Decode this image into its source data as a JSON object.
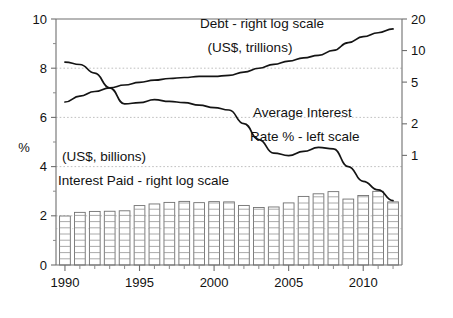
{
  "chart_data": {
    "type": "line",
    "title": "",
    "subtitle": "",
    "xlabel": "",
    "ylabel": "%",
    "y2label": "",
    "grid": true,
    "legend_position": "inline-annotations",
    "x": [
      1990,
      1991,
      1992,
      1993,
      1994,
      1995,
      1996,
      1997,
      1998,
      1999,
      2000,
      2001,
      2002,
      2003,
      2004,
      2005,
      2006,
      2007,
      2008,
      2009,
      2010,
      2011,
      2012
    ],
    "x_tick_labels": [
      "1990",
      "1995",
      "2000",
      "2005",
      "2010"
    ],
    "x_tick_values": [
      1990,
      1995,
      2000,
      2005,
      2010
    ],
    "xlim": [
      1989.4,
      2012.6
    ],
    "left_axis": {
      "label": "%",
      "scale": "linear",
      "ylim": [
        0,
        10
      ],
      "ticks": [
        0,
        2,
        4,
        6,
        8,
        10
      ],
      "tick_labels": [
        "0",
        "2",
        "4",
        "6",
        "8",
        "10"
      ]
    },
    "right_axis": {
      "label": "",
      "scale": "log",
      "ylim": [
        0.09,
        20
      ],
      "ticks": [
        1,
        2,
        5,
        10,
        20
      ],
      "tick_labels": [
        "1",
        "2",
        "5",
        "10",
        "20"
      ]
    },
    "series": [
      {
        "name": "Average Interest Rate % - left scale",
        "axis": "left",
        "unit": "%",
        "type": "line",
        "values": [
          8.25,
          8.15,
          7.8,
          7.2,
          6.55,
          6.6,
          6.72,
          6.65,
          6.6,
          6.5,
          6.4,
          6.3,
          5.75,
          5.1,
          4.55,
          4.45,
          4.62,
          4.78,
          4.72,
          4.0,
          3.4,
          3.05,
          2.62
        ]
      },
      {
        "name": "Debt - right log scale",
        "axis": "right",
        "unit": "US$, trillions",
        "type": "line",
        "values": [
          3.23,
          3.67,
          4.07,
          4.41,
          4.69,
          4.97,
          5.22,
          5.41,
          5.53,
          5.66,
          5.67,
          5.81,
          6.23,
          6.78,
          7.38,
          7.93,
          8.51,
          9.01,
          10.02,
          11.91,
          13.56,
          14.79,
          16.07
        ]
      },
      {
        "name": "Interest Paid - right log scale",
        "axis": "right",
        "unit": "US$, billions",
        "type": "bar",
        "values": [
          264,
          286,
          292,
          293,
          296,
          332,
          344,
          356,
          364,
          354,
          362,
          360,
          333,
          318,
          322,
          352,
          406,
          430,
          451,
          383,
          414,
          454,
          360
        ]
      }
    ],
    "annotations": [
      {
        "id": "debt-label-line1",
        "text": "Debt - right log scale"
      },
      {
        "id": "debt-label-line2",
        "text": "(US$, trillions)"
      },
      {
        "id": "rate-label-line1",
        "text": "Average Interest"
      },
      {
        "id": "rate-label-line2",
        "text": "Rate % - left scale"
      },
      {
        "id": "interest-paid-label-line1",
        "text": "(US$, billions)"
      },
      {
        "id": "interest-paid-label-line2",
        "text": "Interest Paid - right log scale"
      }
    ],
    "colors": {
      "line": "#141414",
      "bar_fill": "#ffffff",
      "bar_stroke": "#707070",
      "grid": "#b9b9b9",
      "axis": "#6f6f6f",
      "background": "#ffffff"
    }
  },
  "left_ticks": [
    "0",
    "2",
    "4",
    "6",
    "8",
    "10"
  ],
  "right_ticks": [
    "1",
    "2",
    "5",
    "10",
    "20"
  ],
  "bottom_ticks": [
    "1990",
    "1995",
    "2000",
    "2005",
    "2010"
  ],
  "axis_title_left": "%",
  "annotations_text": {
    "debt_1": "Debt - right log scale",
    "debt_2": "(US$, trillions)",
    "rate_1": "Average Interest",
    "rate_2": "Rate % - left scale",
    "paid_1": "(US$, billions)",
    "paid_2": "Interest Paid - right log scale"
  }
}
